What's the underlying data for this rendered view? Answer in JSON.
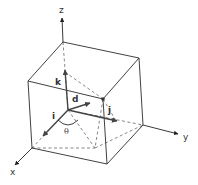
{
  "figure": {
    "axes": {
      "x_label": "x",
      "y_label": "y",
      "z_label": "z"
    },
    "unit_vectors": {
      "i_label": "i",
      "j_label": "j",
      "k_label": "k"
    },
    "direction_vector_label": "d",
    "angle_label": "θ",
    "colors": {
      "lines": "#2b2b2b",
      "vectors": "#444444",
      "point": "#333333"
    }
  }
}
